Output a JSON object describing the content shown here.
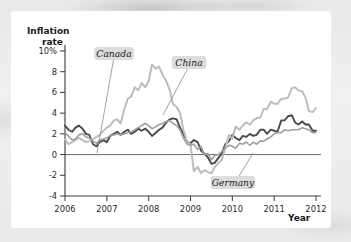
{
  "figure": {
    "background_color": "#ffffff",
    "page_background_color": "#ececed"
  },
  "chart_data": {
    "type": "line",
    "title": "",
    "subtitle": "",
    "xlabel": "Year",
    "ylabel": "Inflation rate",
    "ylabel_line1": "Inflation",
    "ylabel_line2": "rate",
    "xlim": [
      2006,
      2012
    ],
    "ylim": [
      -4,
      10
    ],
    "grid": false,
    "legend_position": "inline-callouts",
    "yticks": [
      10,
      8,
      6,
      4,
      2,
      0,
      -2,
      -4
    ],
    "ytick_labels": [
      "10%",
      "8",
      "6",
      "4",
      "2",
      "0",
      "-2",
      "-4"
    ],
    "xticks": [
      2006,
      2007,
      2008,
      2009,
      2010,
      2011,
      2012
    ],
    "xtick_labels": [
      "2006",
      "2007",
      "2008",
      "2009",
      "2010",
      "2011",
      "2012"
    ],
    "zero_line": 0,
    "annotations": [
      {
        "text": "Canada",
        "series": "Canada",
        "x": 2006.55,
        "y": 9.0
      },
      {
        "text": "China",
        "series": "China",
        "x": 2008.45,
        "y": 8.6
      },
      {
        "text": "Germany",
        "series": "Germany",
        "x": 2010.3,
        "y": -2.0
      }
    ],
    "series": [
      {
        "name": "Canada",
        "color": "#4a4a4a",
        "stroke_width": 1.9,
        "x": [
          2006.0,
          2006.08,
          2006.17,
          2006.25,
          2006.33,
          2006.42,
          2006.5,
          2006.58,
          2006.67,
          2006.75,
          2006.83,
          2006.92,
          2007.0,
          2007.08,
          2007.17,
          2007.25,
          2007.33,
          2007.42,
          2007.5,
          2007.58,
          2007.67,
          2007.75,
          2007.83,
          2007.92,
          2008.0,
          2008.08,
          2008.17,
          2008.25,
          2008.33,
          2008.42,
          2008.5,
          2008.58,
          2008.67,
          2008.75,
          2008.83,
          2008.92,
          2009.0,
          2009.08,
          2009.17,
          2009.25,
          2009.33,
          2009.42,
          2009.5,
          2009.58,
          2009.67,
          2009.75,
          2009.83,
          2009.92,
          2010.0,
          2010.08,
          2010.17,
          2010.25,
          2010.33,
          2010.42,
          2010.5,
          2010.58,
          2010.67,
          2010.75,
          2010.83,
          2010.92,
          2011.0,
          2011.08,
          2011.17,
          2011.25,
          2011.33,
          2011.42,
          2011.5,
          2011.58,
          2011.67,
          2011.75,
          2011.83,
          2011.92,
          2012.0
        ],
        "values": [
          2.8,
          2.4,
          2.2,
          2.6,
          2.8,
          2.5,
          2.0,
          1.9,
          1.0,
          0.8,
          1.2,
          1.4,
          1.2,
          1.8,
          2.0,
          2.2,
          1.9,
          2.2,
          2.4,
          2.0,
          2.2,
          2.5,
          2.3,
          2.5,
          2.2,
          1.8,
          2.1,
          2.4,
          2.6,
          3.1,
          3.4,
          3.5,
          3.4,
          2.6,
          2.0,
          1.2,
          1.1,
          1.4,
          1.2,
          0.4,
          0.1,
          -0.3,
          -0.9,
          -0.8,
          -0.3,
          0.1,
          1.0,
          1.3,
          1.9,
          1.6,
          1.4,
          1.8,
          1.7,
          2.0,
          1.8,
          1.9,
          2.4,
          2.4,
          2.0,
          2.4,
          2.3,
          2.2,
          3.3,
          3.3,
          3.7,
          3.8,
          3.1,
          2.9,
          3.2,
          2.9,
          2.9,
          2.3,
          2.3
        ]
      },
      {
        "name": "China",
        "color": "#bdbdbd",
        "stroke_width": 2.0,
        "x": [
          2006.0,
          2006.08,
          2006.17,
          2006.25,
          2006.33,
          2006.42,
          2006.5,
          2006.58,
          2006.67,
          2006.75,
          2006.83,
          2006.92,
          2007.0,
          2007.08,
          2007.17,
          2007.25,
          2007.33,
          2007.42,
          2007.5,
          2007.58,
          2007.67,
          2007.75,
          2007.83,
          2007.92,
          2008.0,
          2008.08,
          2008.17,
          2008.25,
          2008.33,
          2008.42,
          2008.5,
          2008.58,
          2008.67,
          2008.75,
          2008.83,
          2008.92,
          2009.0,
          2009.08,
          2009.17,
          2009.25,
          2009.33,
          2009.42,
          2009.5,
          2009.58,
          2009.67,
          2009.75,
          2009.83,
          2009.92,
          2010.0,
          2010.08,
          2010.17,
          2010.25,
          2010.33,
          2010.42,
          2010.5,
          2010.58,
          2010.67,
          2010.75,
          2010.83,
          2010.92,
          2011.0,
          2011.08,
          2011.17,
          2011.25,
          2011.33,
          2011.42,
          2011.5,
          2011.58,
          2011.67,
          2011.75,
          2011.83,
          2011.92,
          2012.0
        ],
        "values": [
          1.5,
          1.0,
          1.2,
          1.4,
          1.6,
          1.4,
          1.2,
          1.3,
          1.5,
          1.7,
          1.9,
          2.3,
          2.6,
          2.8,
          3.3,
          3.4,
          3.0,
          4.4,
          5.4,
          5.6,
          6.5,
          6.2,
          6.9,
          6.5,
          7.1,
          8.7,
          8.3,
          8.5,
          7.7,
          7.1,
          6.3,
          4.9,
          4.6,
          4.0,
          2.4,
          1.2,
          1.0,
          -1.6,
          -1.2,
          -1.8,
          -1.5,
          -1.7,
          -1.8,
          -1.2,
          -0.8,
          -0.5,
          0.6,
          1.9,
          1.5,
          2.7,
          2.4,
          2.8,
          3.1,
          2.9,
          3.3,
          3.5,
          3.6,
          4.4,
          4.4,
          5.1,
          4.9,
          4.9,
          5.4,
          5.4,
          5.5,
          6.4,
          6.5,
          6.2,
          6.1,
          5.5,
          4.2,
          4.1,
          4.5
        ]
      },
      {
        "name": "Germany",
        "color": "#9f9f9f",
        "stroke_width": 1.6,
        "x": [
          2006.0,
          2006.08,
          2006.17,
          2006.25,
          2006.33,
          2006.42,
          2006.5,
          2006.58,
          2006.67,
          2006.75,
          2006.83,
          2006.92,
          2007.0,
          2007.08,
          2007.17,
          2007.25,
          2007.33,
          2007.42,
          2007.5,
          2007.58,
          2007.67,
          2007.75,
          2007.83,
          2007.92,
          2008.0,
          2008.08,
          2008.17,
          2008.25,
          2008.33,
          2008.42,
          2008.5,
          2008.58,
          2008.67,
          2008.75,
          2008.83,
          2008.92,
          2009.0,
          2009.08,
          2009.17,
          2009.25,
          2009.33,
          2009.42,
          2009.5,
          2009.58,
          2009.67,
          2009.75,
          2009.83,
          2009.92,
          2010.0,
          2010.08,
          2010.17,
          2010.25,
          2010.33,
          2010.42,
          2010.5,
          2010.58,
          2010.67,
          2010.75,
          2010.83,
          2010.92,
          2011.0,
          2011.08,
          2011.17,
          2011.25,
          2011.33,
          2011.42,
          2011.5,
          2011.58,
          2011.67,
          2011.75,
          2011.83,
          2011.92,
          2012.0
        ],
        "values": [
          2.1,
          1.8,
          1.4,
          1.5,
          1.9,
          2.0,
          1.7,
          1.6,
          1.3,
          1.1,
          1.4,
          1.5,
          1.6,
          1.8,
          1.9,
          2.0,
          1.9,
          2.0,
          2.1,
          2.2,
          2.4,
          2.6,
          2.8,
          3.0,
          2.8,
          2.5,
          2.7,
          2.9,
          3.0,
          3.2,
          3.3,
          3.0,
          2.8,
          2.4,
          1.6,
          1.0,
          0.9,
          1.0,
          0.5,
          0.8,
          0.0,
          0.1,
          -0.5,
          -0.1,
          0.0,
          0.3,
          0.6,
          0.9,
          0.8,
          0.6,
          1.1,
          1.0,
          1.2,
          0.9,
          1.2,
          1.0,
          1.3,
          1.3,
          1.5,
          1.7,
          2.0,
          2.1,
          2.1,
          2.4,
          2.3,
          2.4,
          2.4,
          2.4,
          2.6,
          2.5,
          2.4,
          2.1,
          2.1
        ]
      }
    ]
  }
}
